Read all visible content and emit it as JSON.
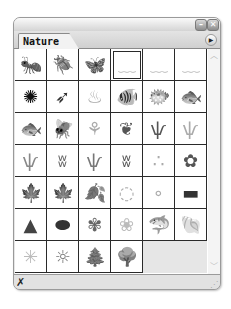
{
  "panel": {
    "tab_label": "Nature",
    "buttons": {
      "minimize": "–",
      "close": "✕",
      "menu": "▶"
    }
  },
  "swatches": [
    {
      "name": "ant",
      "glyph": "🐜",
      "shade": "#222"
    },
    {
      "name": "beetle",
      "glyph": "🪲",
      "shade": "#222"
    },
    {
      "name": "butterfly",
      "glyph": "🦋",
      "shade": "#444"
    },
    {
      "name": "cloud-wisp-1",
      "glyph": "﹏",
      "shade": "#ccc",
      "selected": true
    },
    {
      "name": "cloud-wisp-2",
      "glyph": "﹏",
      "shade": "#ccc"
    },
    {
      "name": "cloud-wisp-3",
      "glyph": "﹏",
      "shade": "#ccc"
    },
    {
      "name": "shrub-dark",
      "glyph": "✺",
      "shade": "#111"
    },
    {
      "name": "feather",
      "glyph": "➶",
      "shade": "#333"
    },
    {
      "name": "grass-flame",
      "glyph": "♨",
      "shade": "#aaa"
    },
    {
      "name": "tropical-fish",
      "glyph": "🐠",
      "shade": "#444"
    },
    {
      "name": "flat-fish",
      "glyph": "🐡",
      "shade": "#666"
    },
    {
      "name": "small-fish",
      "glyph": "🐟",
      "shade": "#444"
    },
    {
      "name": "spotted-fish",
      "glyph": "🐟",
      "shade": "#333"
    },
    {
      "name": "fly",
      "glyph": "🪰",
      "shade": "#222"
    },
    {
      "name": "reed-plant",
      "glyph": "⚘",
      "shade": "#aaa"
    },
    {
      "name": "coral",
      "glyph": "❦",
      "shade": "#555"
    },
    {
      "name": "grass-blades",
      "glyph": "ѱ",
      "shade": "#555"
    },
    {
      "name": "grass-light",
      "glyph": "ѱ",
      "shade": "#aaa"
    },
    {
      "name": "grass-tuft",
      "glyph": "ѱ",
      "shade": "#888"
    },
    {
      "name": "grass-strip",
      "glyph": "ʬ",
      "shade": "#666"
    },
    {
      "name": "grass-thin",
      "glyph": "ѱ",
      "shade": "#777"
    },
    {
      "name": "grass-dense",
      "glyph": "ʬ",
      "shade": "#555"
    },
    {
      "name": "pebbles",
      "glyph": "∴",
      "shade": "#aaa"
    },
    {
      "name": "flower",
      "glyph": "✿",
      "shade": "#555"
    },
    {
      "name": "maple-leaf-light",
      "glyph": "🍁",
      "shade": "#777"
    },
    {
      "name": "maple-leaf-dark",
      "glyph": "🍁",
      "shade": "#333"
    },
    {
      "name": "leaf",
      "glyph": "🍂",
      "shade": "#555"
    },
    {
      "name": "stone-small",
      "glyph": "◌",
      "shade": "#aaa"
    },
    {
      "name": "pebble-tiny",
      "glyph": "∘",
      "shade": "#aaa"
    },
    {
      "name": "stone-long",
      "glyph": "▬",
      "shade": "#333"
    },
    {
      "name": "rock-mound",
      "glyph": "▲",
      "shade": "#444"
    },
    {
      "name": "rock-oval",
      "glyph": "⬬",
      "shade": "#333"
    },
    {
      "name": "flower-blossom",
      "glyph": "✾",
      "shade": "#666"
    },
    {
      "name": "flower-faint",
      "glyph": "❀",
      "shade": "#bbb"
    },
    {
      "name": "shark",
      "glyph": "🦈",
      "shade": "#333"
    },
    {
      "name": "shell",
      "glyph": "🐚",
      "shade": "#444"
    },
    {
      "name": "star-burst-light",
      "glyph": "✳",
      "shade": "#bbb"
    },
    {
      "name": "sun-burst",
      "glyph": "☼",
      "shade": "#777"
    },
    {
      "name": "pine-trees",
      "glyph": "🌲",
      "shade": "#222"
    },
    {
      "name": "tree-grove",
      "glyph": "🌳",
      "shade": "#333"
    },
    {
      "name": "empty",
      "glyph": "",
      "shade": "",
      "empty": true
    },
    {
      "name": "empty",
      "glyph": "",
      "shade": "",
      "empty": true
    }
  ],
  "scrollbar": {
    "up": "︿",
    "down": "﹀"
  },
  "status": {
    "icon": "✗",
    "grip": "⋰"
  }
}
